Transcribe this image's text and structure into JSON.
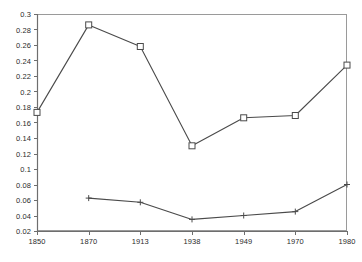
{
  "chart_data": {
    "type": "line",
    "title": "",
    "xlabel": "",
    "ylabel": "",
    "categories": [
      "1850",
      "1870",
      "1913",
      "1938",
      "1949",
      "1970",
      "1980"
    ],
    "ylim": [
      0.02,
      0.3
    ],
    "ytick_labels": [
      "0.3",
      "0.28",
      "0.26",
      "0.24",
      "0.22",
      "0.2",
      "0.18",
      "0.16",
      "0.14",
      "0.12",
      "0.1",
      "0.08",
      "0.06",
      "0.04",
      "0.02"
    ],
    "ytick_values": [
      0.3,
      0.28,
      0.26,
      0.24,
      0.22,
      0.2,
      0.18,
      0.16,
      0.14,
      0.12,
      0.1,
      0.08,
      0.06,
      0.04,
      0.02
    ],
    "grid": false,
    "legend": "none",
    "series": [
      {
        "name": "series-square",
        "marker": "square",
        "color": "#4a4a4a",
        "x": [
          "1850",
          "1870",
          "1913",
          "1938",
          "1949",
          "1970",
          "1980"
        ],
        "values": [
          0.173,
          0.286,
          0.258,
          0.13,
          0.166,
          0.169,
          0.234
        ]
      },
      {
        "name": "series-plus",
        "marker": "plus",
        "color": "#4a4a4a",
        "x": [
          "1870",
          "1913",
          "1938",
          "1949",
          "1970",
          "1980"
        ],
        "values": [
          0.0625,
          0.057,
          0.035,
          0.04,
          0.045,
          0.08
        ]
      }
    ]
  },
  "style": {
    "frame_color": "#9a9a9a",
    "axis_color": "#6e6e6e",
    "line_color": "#55555a",
    "text_color": "#2b2b2b",
    "background": "#ffffff"
  },
  "geometry": {
    "plot_left": 37,
    "plot_right": 347,
    "plot_top": 14,
    "plot_bottom": 231
  }
}
